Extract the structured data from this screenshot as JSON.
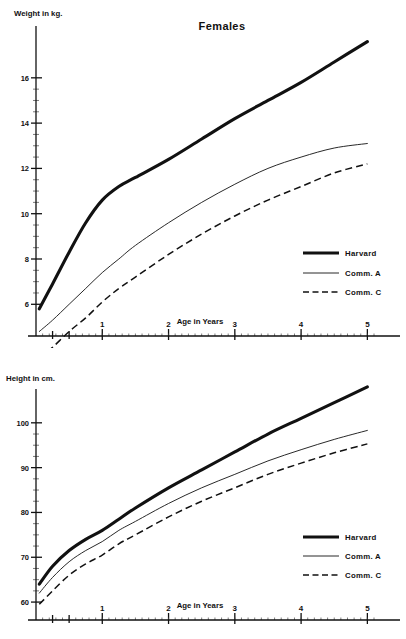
{
  "figure": {
    "title": "Females",
    "background": "#ffffff",
    "ink_color": "#111111"
  },
  "chart_data": [
    {
      "type": "line",
      "id": "weight-chart",
      "title": "Females",
      "xlabel": "Age in Years",
      "ylabel": "Weight in kg.",
      "xlim": [
        0,
        5.1
      ],
      "ylim": [
        4.6,
        18.2
      ],
      "xticks": [
        "1",
        "2",
        "3",
        "4",
        "5"
      ],
      "xtick_values": [
        1,
        2,
        3,
        4,
        5
      ],
      "minor_xticks": [
        0.25,
        0.5
      ],
      "yticks": [
        "6",
        "8",
        "10",
        "12",
        "14",
        "16"
      ],
      "ytick_values": [
        6,
        8,
        10,
        12,
        14,
        16
      ],
      "grid": false,
      "legend_position": "lower-right",
      "x": [
        0.05,
        0.25,
        0.5,
        0.75,
        1,
        1.25,
        1.5,
        2,
        2.5,
        3,
        3.5,
        4,
        4.5,
        5
      ],
      "series": [
        {
          "name": "Harvard",
          "style": "thick-solid",
          "values": [
            5.8,
            6.9,
            8.3,
            9.6,
            10.6,
            11.2,
            11.6,
            12.4,
            13.3,
            14.2,
            15.0,
            15.8,
            16.7,
            17.6
          ]
        },
        {
          "name": "Comm. A",
          "style": "thin-solid",
          "values": [
            4.8,
            5.3,
            6.0,
            6.7,
            7.4,
            8.0,
            8.6,
            9.6,
            10.5,
            11.3,
            12.0,
            12.5,
            12.9,
            13.1
          ]
        },
        {
          "name": "Comm. C",
          "style": "dashed",
          "values": [
            3.6,
            4.1,
            4.8,
            5.4,
            6.1,
            6.7,
            7.2,
            8.2,
            9.1,
            9.9,
            10.6,
            11.2,
            11.8,
            12.2
          ]
        }
      ]
    },
    {
      "type": "line",
      "id": "height-chart",
      "title": "",
      "xlabel": "Age in Years",
      "ylabel": "Height in cm.",
      "xlim": [
        0,
        5.1
      ],
      "ylim": [
        56,
        110
      ],
      "xticks": [
        "1",
        "2",
        "3",
        "4",
        "5"
      ],
      "xtick_values": [
        1,
        2,
        3,
        4,
        5
      ],
      "minor_xticks": [
        0.25,
        0.5
      ],
      "yticks": [
        "60",
        "70",
        "80",
        "90",
        "100"
      ],
      "ytick_values": [
        60,
        70,
        80,
        90,
        100
      ],
      "grid": false,
      "legend_position": "lower-right",
      "x": [
        0.05,
        0.25,
        0.5,
        0.75,
        1,
        1.25,
        1.5,
        2,
        2.5,
        3,
        3.5,
        4,
        4.5,
        5
      ],
      "series": [
        {
          "name": "Harvard",
          "style": "thick-solid",
          "values": [
            64.0,
            68.0,
            71.5,
            74.0,
            76.0,
            78.5,
            81.0,
            85.5,
            89.5,
            93.5,
            97.5,
            101.0,
            104.5,
            108.0
          ]
        },
        {
          "name": "Comm. A",
          "style": "thin-solid",
          "values": [
            62.0,
            65.5,
            69.0,
            71.5,
            73.5,
            76.0,
            78.0,
            82.0,
            85.5,
            88.5,
            91.5,
            94.0,
            96.3,
            98.3
          ]
        },
        {
          "name": "Comm. C",
          "style": "dashed",
          "values": [
            59.5,
            62.5,
            66.0,
            68.5,
            70.5,
            73.0,
            75.0,
            79.0,
            82.5,
            85.5,
            88.5,
            91.0,
            93.3,
            95.3
          ]
        }
      ]
    }
  ],
  "legend": {
    "entries": [
      {
        "label": "Harvard",
        "style": "thick-solid"
      },
      {
        "label": "Comm. A",
        "style": "thin-solid"
      },
      {
        "label": "Comm. C",
        "style": "dashed"
      }
    ]
  }
}
